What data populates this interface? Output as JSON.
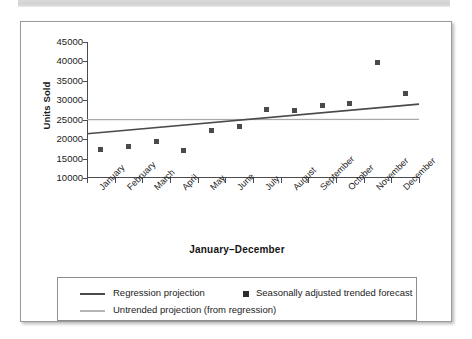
{
  "chart_data": {
    "type": "scatter",
    "title": "",
    "xlabel": "January–December",
    "ylabel": "Units Sold",
    "ylim": [
      10000,
      45000
    ],
    "ytick_values": [
      45000,
      40000,
      35000,
      30000,
      25000,
      20000,
      15000,
      10000
    ],
    "ytick_labels": [
      "45000",
      "40000",
      "35000",
      "30000",
      "25000",
      "20000",
      "15000",
      "10000"
    ],
    "grid": false,
    "legend_position": "below-plot",
    "categories": [
      "January",
      "February",
      "March",
      "April",
      "May",
      "June",
      "July",
      "August",
      "September",
      "October",
      "November",
      "December"
    ],
    "series": [
      {
        "name": "Seasonally adjusted trended forecast",
        "type": "scatter",
        "marker": "square",
        "color": "#4a4a4a",
        "values": [
          17300,
          18200,
          19300,
          17100,
          22100,
          23300,
          27600,
          27400,
          28700,
          29300,
          39700,
          31700
        ]
      },
      {
        "name": "Regression projection",
        "type": "line",
        "color": "#4a4a4a",
        "endpoints": [
          21400,
          29000
        ]
      },
      {
        "name": "Untrended projection (from regression)",
        "type": "line",
        "color": "#a9a9a9",
        "endpoints": [
          25000,
          25100
        ]
      }
    ]
  },
  "axis": {
    "y_title": "Units Sold",
    "x_title": "January–December"
  },
  "legend": {
    "items": [
      {
        "label": "Regression projection",
        "marker": "line",
        "color": "#4a4a4a"
      },
      {
        "label": "Seasonally adjusted trended forecast",
        "marker": "square",
        "color": "#2c2c2c"
      },
      {
        "label": "Untrended projection (from regression)",
        "marker": "line",
        "color": "#a9a9a9"
      }
    ]
  }
}
